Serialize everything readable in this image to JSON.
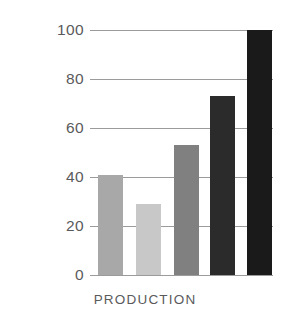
{
  "chart_data": {
    "type": "bar",
    "title": "",
    "subtitle": "",
    "xlabel": "PRODUCTION",
    "ylabel": "",
    "categories": [
      "1",
      "2",
      "3",
      "4",
      "5"
    ],
    "values": [
      41,
      29,
      53,
      73,
      100
    ],
    "series": [
      {
        "name": "Production",
        "values": [
          41,
          29,
          53,
          73,
          100
        ]
      }
    ],
    "bar_colors": [
      "#a8a8a8",
      "#c8c8c8",
      "#808080",
      "#2b2b2b",
      "#1a1a1a"
    ],
    "ylim": [
      0,
      100
    ],
    "yticks": [
      100,
      80,
      60,
      40,
      20,
      0
    ],
    "ytick_labels": [
      "100",
      "80",
      "60",
      "40",
      "20",
      "0"
    ],
    "xtick_labels": [
      "",
      "",
      "",
      "",
      ""
    ],
    "grid": "horizontal",
    "gridline_color": "#8a8a8c",
    "legend": "none",
    "legend_position": "none",
    "background_color": "#ffffff",
    "text_color": "#5a5a5c",
    "annotations": []
  },
  "axis": {
    "x_label_text": "PRODUCTION"
  }
}
